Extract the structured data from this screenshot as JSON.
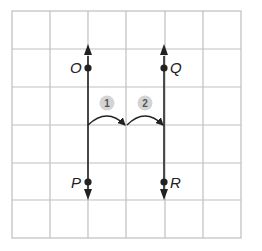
{
  "grid": {
    "columns": 6,
    "rows": 6,
    "line_color": "#bfbfbf"
  },
  "lines": [
    {
      "id": "left-line",
      "from_point": "O",
      "to_point": "P",
      "direction": "both"
    },
    {
      "id": "right-line",
      "from_point": "Q",
      "to_point": "R",
      "direction": "both"
    }
  ],
  "points": {
    "O": {
      "label": "O"
    },
    "P": {
      "label": "P"
    },
    "Q": {
      "label": "Q"
    },
    "R": {
      "label": "R"
    }
  },
  "steps": [
    {
      "label": "1"
    },
    {
      "label": "2"
    }
  ],
  "colors": {
    "ink": "#222222",
    "step_fill": "#d4d4d4",
    "step_text": "#555555"
  }
}
